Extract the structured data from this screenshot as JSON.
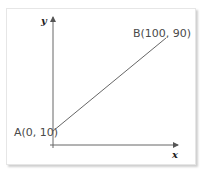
{
  "diagram": {
    "type": "line-graph",
    "axes": {
      "x_label": "x",
      "y_label": "y"
    },
    "points": [
      {
        "name": "A",
        "label": "A(0, 10)",
        "x": 0,
        "y": 10
      },
      {
        "name": "B",
        "label": "B(100, 90)",
        "x": 100,
        "y": 90
      }
    ],
    "colors": {
      "line": "#555555",
      "axis": "#555555",
      "text": "#4a4a4a"
    }
  }
}
